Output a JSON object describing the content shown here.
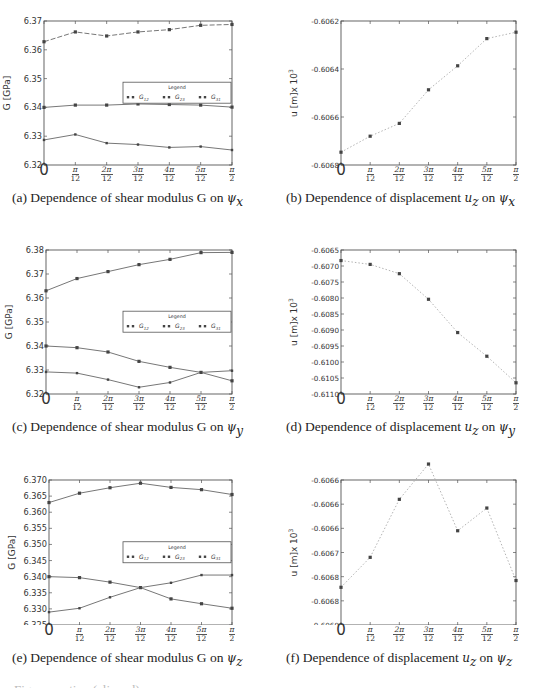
{
  "figure": {
    "x_tick_labels": [
      {
        "num": "",
        "den": "",
        "plain": "0"
      },
      {
        "num": "π",
        "den": "12"
      },
      {
        "num": "2π",
        "den": "12"
      },
      {
        "num": "3π",
        "den": "12"
      },
      {
        "num": "4π",
        "den": "12"
      },
      {
        "num": "5π",
        "den": "12"
      },
      {
        "num": "π",
        "den": "2"
      }
    ],
    "captions": {
      "a": {
        "prefix": "(a) Dependence of shear modulus G on ",
        "sym": "ψ",
        "sub": "x"
      },
      "b": {
        "prefix": "(b) Dependence of displacement ",
        "u": "u",
        "usub": "z",
        "mid": " on ",
        "sym": "ψ",
        "sub": "x"
      },
      "c": {
        "prefix": "(c) Dependence of shear modulus G on ",
        "sym": "ψ",
        "sub": "y"
      },
      "d": {
        "prefix": "(d) Dependence of displacement ",
        "u": "u",
        "usub": "z",
        "mid": " on ",
        "sym": "ψ",
        "sub": "y"
      },
      "e": {
        "prefix": "(e) Dependence of shear modulus G on ",
        "sym": "ψ",
        "sub": "z"
      },
      "f": {
        "prefix": "(f) Dependence of displacement ",
        "u": "u",
        "usub": "z",
        "mid": " on ",
        "sym": "ψ",
        "sub": "z"
      }
    },
    "bottom_cutoff_text": "Figure caption (clipped)"
  },
  "chart_data": [
    {
      "id": "a",
      "type": "line",
      "title": "(a) Dependence of shear modulus G on ψx",
      "xlabel": "",
      "ylabel": "G [GPa]",
      "categories": [
        "0",
        "π/12",
        "2π/12",
        "3π/12",
        "4π/12",
        "5π/12",
        "π/2"
      ],
      "ylim": [
        6.32,
        6.37
      ],
      "yticks": [
        "6.32",
        "6.33",
        "6.34",
        "6.35",
        "6.36",
        "6.37"
      ],
      "legend": {
        "title": "Legend",
        "entries": [
          "G12",
          "G23",
          "G31"
        ],
        "position": "center-right"
      },
      "series": [
        {
          "name": "G12",
          "values": [
            6.3628,
            6.3662,
            6.3648,
            6.3662,
            6.367,
            6.3685,
            6.3688
          ]
        },
        {
          "name": "G23",
          "values": [
            6.34,
            6.3408,
            6.3408,
            6.3412,
            6.341,
            6.3408,
            6.3401
          ]
        },
        {
          "name": "G31",
          "values": [
            6.3287,
            6.3306,
            6.3276,
            6.3271,
            6.3261,
            6.3264,
            6.3252
          ]
        }
      ]
    },
    {
      "id": "b",
      "type": "line",
      "title": "(b) Dependence of displacement uz on ψx",
      "xlabel": "",
      "ylabel": "u [m]x 10^3",
      "categories": [
        "0",
        "π/12",
        "2π/12",
        "3π/12",
        "4π/12",
        "5π/12",
        "π/2"
      ],
      "ylim": [
        -0.6069,
        -0.606
      ],
      "yticks": [
        "-0.6068",
        "-0.6066",
        "-0.6064",
        "-0.6062"
      ],
      "series": [
        {
          "name": "uz",
          "values": [
            -0.60682,
            -0.60672,
            -0.60664,
            -0.60643,
            -0.60628,
            -0.60611,
            -0.60607
          ]
        }
      ]
    },
    {
      "id": "c",
      "type": "line",
      "title": "(c) Dependence of shear modulus G on ψy",
      "xlabel": "",
      "ylabel": "G [GPa]",
      "categories": [
        "0",
        "π/12",
        "2π/12",
        "3π/12",
        "4π/12",
        "5π/12",
        "π/2"
      ],
      "ylim": [
        6.32,
        6.38
      ],
      "yticks": [
        "6.32",
        "6.33",
        "6.34",
        "6.35",
        "6.36",
        "6.37",
        "6.38"
      ],
      "legend": {
        "title": "Legend",
        "entries": [
          "G12",
          "G23",
          "G31"
        ],
        "position": "center-right"
      },
      "series": [
        {
          "name": "G12",
          "values": [
            6.363,
            6.3681,
            6.371,
            6.3739,
            6.3761,
            6.3789,
            6.379
          ]
        },
        {
          "name": "G23",
          "values": [
            6.34,
            6.3393,
            6.3375,
            6.3336,
            6.3311,
            6.329,
            6.3255
          ]
        },
        {
          "name": "G31",
          "values": [
            6.3292,
            6.3287,
            6.326,
            6.3228,
            6.3248,
            6.329,
            6.3297
          ]
        }
      ]
    },
    {
      "id": "d",
      "type": "line",
      "title": "(d) Dependence of displacement uz on ψy",
      "xlabel": "",
      "ylabel": "u [m]x 10^3",
      "categories": [
        "0",
        "π/12",
        "2π/12",
        "3π/12",
        "4π/12",
        "5π/12",
        "π/2"
      ],
      "ylim": [
        -0.611,
        -0.6065
      ],
      "yticks": [
        "-0.6110",
        "-0.6105",
        "-0.6100",
        "-0.6095",
        "-0.6090",
        "-0.6085",
        "-0.6080",
        "-0.6075",
        "-0.6070",
        "-0.6065"
      ],
      "series": [
        {
          "name": "uz",
          "values": [
            -0.60683,
            -0.60695,
            -0.60724,
            -0.60804,
            -0.60908,
            -0.60982,
            -0.61065
          ]
        }
      ]
    },
    {
      "id": "e",
      "type": "line",
      "title": "(e) Dependence of shear modulus G on ψz",
      "xlabel": "",
      "ylabel": "G [GPa]",
      "categories": [
        "0",
        "π/12",
        "2π/12",
        "3π/12",
        "4π/12",
        "5π/12",
        "π/2"
      ],
      "ylim": [
        6.325,
        6.37
      ],
      "yticks": [
        "6.325",
        "6.330",
        "6.335",
        "6.340",
        "6.345",
        "6.350",
        "6.355",
        "6.360",
        "6.365",
        "6.370"
      ],
      "legend": {
        "title": "Legend",
        "entries": [
          "G12",
          "G23",
          "G31"
        ],
        "position": "center-right"
      },
      "series": [
        {
          "name": "G12",
          "values": [
            6.363,
            6.3659,
            6.3676,
            6.369,
            6.3677,
            6.367,
            6.3655
          ]
        },
        {
          "name": "G23",
          "values": [
            6.34,
            6.3397,
            6.3383,
            6.3366,
            6.3331,
            6.3316,
            6.3302
          ]
        },
        {
          "name": "G31",
          "values": [
            6.329,
            6.3302,
            6.3336,
            6.3366,
            6.3381,
            6.3405,
            6.3405
          ]
        }
      ]
    },
    {
      "id": "f",
      "type": "line",
      "title": "(f) Dependence of displacement uz on ψz",
      "xlabel": "",
      "ylabel": "u [m]x 10^3",
      "categories": [
        "0",
        "π/12",
        "2π/12",
        "3π/12",
        "4π/12",
        "5π/12",
        "π/2"
      ],
      "ylim": [
        -0.6069,
        -0.6066
      ],
      "yticks": [
        "-0.6069",
        "-0.6068",
        "-0.6068",
        "-0.6067",
        "-0.6066",
        "-0.6066",
        "-0.6066"
      ],
      "series": [
        {
          "name": "uz",
          "values": [
            -0.606822,
            -0.60676,
            -0.60664,
            -0.606567,
            -0.606705,
            -0.606658,
            -0.606808
          ]
        }
      ]
    }
  ]
}
